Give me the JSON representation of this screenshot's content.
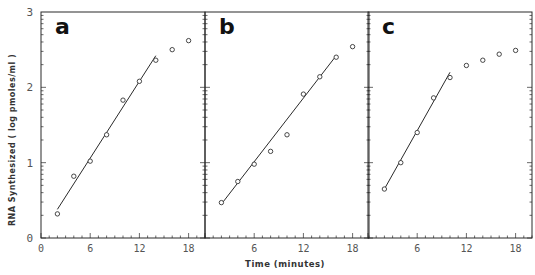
{
  "chart_data": {
    "type": "scatter",
    "title": "",
    "xlabel": "Time (minutes)",
    "ylabel": "RNA Synthesized (log pmoles/ml)",
    "ylim": [
      0,
      3
    ],
    "xlim": [
      0,
      20
    ],
    "x_ticks": [
      "0",
      "6",
      "12",
      "18"
    ],
    "y_ticks": [
      "0",
      "1",
      "2",
      "3"
    ],
    "grid": false,
    "legend": null,
    "panels": [
      {
        "label": "a",
        "x": [
          2,
          4,
          6,
          8,
          10,
          12,
          14,
          16,
          18
        ],
        "y": [
          0.32,
          0.82,
          1.02,
          1.37,
          1.83,
          2.08,
          2.36,
          2.5,
          2.62
        ],
        "fit_line": {
          "x": [
            2,
            14
          ],
          "y": [
            0.38,
            2.42
          ]
        }
      },
      {
        "label": "b",
        "x": [
          2,
          4,
          6,
          8,
          10,
          12,
          14,
          16,
          18
        ],
        "y": [
          0.47,
          0.75,
          0.98,
          1.15,
          1.37,
          1.91,
          2.14,
          2.4,
          2.54
        ],
        "fit_line": {
          "x": [
            2,
            16
          ],
          "y": [
            0.45,
            2.42
          ]
        }
      },
      {
        "label": "c",
        "x": [
          2,
          4,
          6,
          8,
          10,
          12,
          14,
          16,
          18
        ],
        "y": [
          0.65,
          1.0,
          1.4,
          1.86,
          2.13,
          2.29,
          2.36,
          2.44,
          2.49
        ],
        "fit_line": {
          "x": [
            2,
            10
          ],
          "y": [
            0.65,
            2.2
          ]
        }
      }
    ]
  },
  "axes": {
    "xlabel": "Time (minutes)",
    "ylabel": "RNA   Synthesized   ( log  pmoles/ml )"
  },
  "style": {
    "ink": "#2a2a2a",
    "marker_stroke": "#333333"
  }
}
